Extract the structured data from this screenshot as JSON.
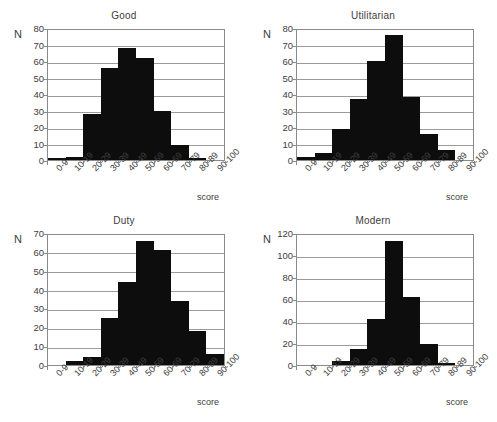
{
  "figure": {
    "background": "#ffffff",
    "bar_color": "#0d0d0d",
    "axis_color": "#8a8a8a",
    "text_color": "#3d3d3d",
    "caption": ""
  },
  "axis_common": {
    "ylabel": "N",
    "xlabel": "score",
    "categories": [
      "0-9",
      "10-19",
      "20-29",
      "30-39",
      "40-49",
      "50-59",
      "60-69",
      "70-79",
      "80-89",
      "90-100"
    ]
  },
  "chart_data": [
    {
      "type": "bar",
      "title": "Good",
      "xlabel": "score",
      "ylabel": "N",
      "categories": [
        "0-9",
        "10-19",
        "20-29",
        "30-39",
        "40-49",
        "50-59",
        "60-69",
        "70-79",
        "80-89",
        "90-100"
      ],
      "values": [
        1,
        2,
        28,
        56,
        68,
        62,
        30,
        9,
        1,
        0
      ],
      "ylim": [
        0,
        80
      ],
      "yticks": [
        0,
        10,
        20,
        30,
        40,
        50,
        60,
        70,
        80
      ],
      "grid": true,
      "legend": "none"
    },
    {
      "type": "bar",
      "title": "Utilitarian",
      "xlabel": "score",
      "ylabel": "N",
      "categories": [
        "0-9",
        "10-19",
        "20-29",
        "30-39",
        "40-49",
        "50-59",
        "60-69",
        "70-79",
        "80-89",
        "90-100"
      ],
      "values": [
        2,
        4,
        19,
        37,
        60,
        76,
        38,
        16,
        6,
        0
      ],
      "ylim": [
        0,
        80
      ],
      "yticks": [
        0,
        10,
        20,
        30,
        40,
        50,
        60,
        70,
        80
      ],
      "grid": true,
      "legend": "none"
    },
    {
      "type": "bar",
      "title": "Duty",
      "xlabel": "score",
      "ylabel": "N",
      "categories": [
        "0-9",
        "10-19",
        "20-29",
        "30-39",
        "40-49",
        "50-59",
        "60-69",
        "70-79",
        "80-89",
        "90-100"
      ],
      "values": [
        0,
        2,
        4,
        25,
        44,
        66,
        61,
        34,
        18,
        6
      ],
      "ylim": [
        0,
        70
      ],
      "yticks": [
        0,
        10,
        20,
        30,
        40,
        50,
        60,
        70
      ],
      "grid": true,
      "legend": "none"
    },
    {
      "type": "bar",
      "title": "Modern",
      "xlabel": "score",
      "ylabel": "N",
      "categories": [
        "0-9",
        "10-19",
        "20-29",
        "30-39",
        "40-49",
        "50-59",
        "60-69",
        "70-79",
        "80-89",
        "90-100"
      ],
      "values": [
        0,
        0,
        4,
        15,
        42,
        113,
        62,
        19,
        2,
        0
      ],
      "ylim": [
        0,
        120
      ],
      "yticks": [
        0,
        20,
        40,
        60,
        80,
        100,
        120
      ],
      "grid": true,
      "legend": "none"
    }
  ]
}
